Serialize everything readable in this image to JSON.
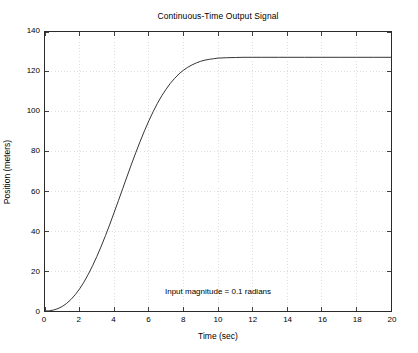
{
  "chart_data": {
    "type": "line",
    "title": "Continuous-Time Output Signal",
    "xlabel": "Time  (sec)",
    "ylabel": "Position  (meters)",
    "xlim": [
      0,
      20
    ],
    "ylim": [
      0,
      140
    ],
    "xticks": [
      0,
      2,
      4,
      6,
      8,
      10,
      12,
      14,
      16,
      18,
      20
    ],
    "yticks": [
      0,
      20,
      40,
      60,
      80,
      100,
      120,
      140
    ],
    "xtick_labels": [
      "0",
      "2",
      "4",
      "6",
      "8",
      "10",
      "12",
      "14",
      "16",
      "18",
      "20"
    ],
    "ytick_labels": [
      "0",
      "20",
      "40",
      "60",
      "80",
      "100",
      "120",
      "140"
    ],
    "grid": true,
    "grid_style": "dotted",
    "legend": "none",
    "line_color": "#333333",
    "annotations": [
      {
        "text": "Input magnitude = 0.1 radians",
        "x": 10,
        "y": 12
      }
    ],
    "series": [
      {
        "name": "Position",
        "x": [
          0,
          0.25,
          0.5,
          0.75,
          1,
          1.25,
          1.5,
          1.75,
          2,
          2.25,
          2.5,
          2.75,
          3,
          3.25,
          3.5,
          3.75,
          4,
          4.25,
          4.5,
          4.75,
          5,
          5.25,
          5.5,
          5.75,
          6,
          6.25,
          6.5,
          6.75,
          7,
          7.25,
          7.5,
          7.75,
          8,
          8.25,
          8.5,
          8.75,
          9,
          9.25,
          9.5,
          9.75,
          10,
          10.5,
          11,
          11.5,
          12,
          12.5,
          13,
          13.5,
          14,
          15,
          16,
          17,
          18,
          19,
          20
        ],
        "y": [
          0,
          0.1,
          0.5,
          1.2,
          2.3,
          3.8,
          5.8,
          8.2,
          11.1,
          14.5,
          18.4,
          22.7,
          27.4,
          32.5,
          37.9,
          43.6,
          49.5,
          55.5,
          61.6,
          67.7,
          73.7,
          79.5,
          85.1,
          90.4,
          95.4,
          100.0,
          104.2,
          108.0,
          111.3,
          114.3,
          116.8,
          119.0,
          120.8,
          122.3,
          123.5,
          124.5,
          125.3,
          125.9,
          126.3,
          126.6,
          126.9,
          127.1,
          127.2,
          127.3,
          127.3,
          127.3,
          127.3,
          127.3,
          127.3,
          127.3,
          127.3,
          127.3,
          127.3,
          127.3,
          127.3
        ]
      }
    ]
  }
}
